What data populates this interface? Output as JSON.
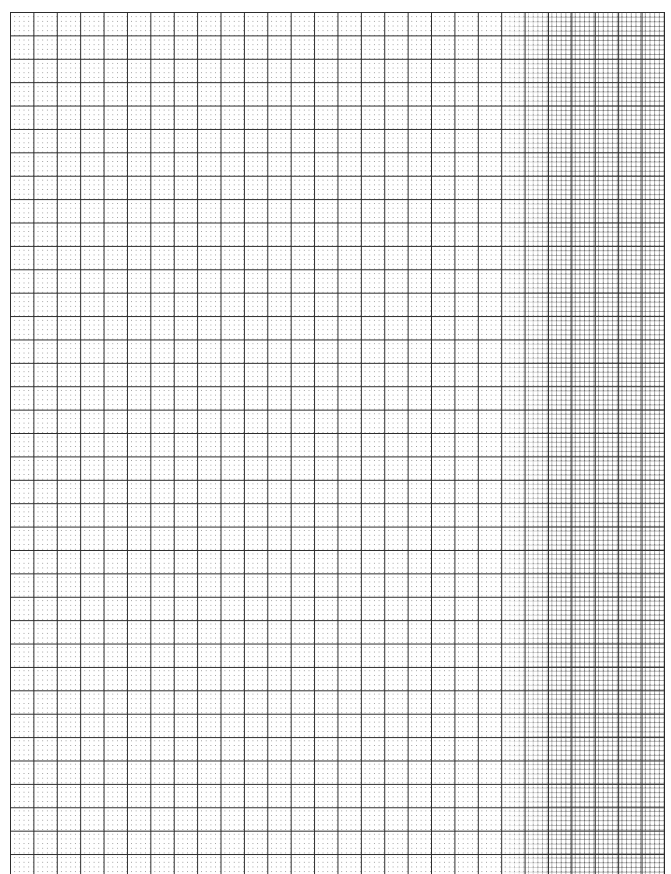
{
  "document": {
    "type": "blank graph paper",
    "grid": {
      "major_spacing_px": 23.4,
      "minor_divisions_per_major": 5,
      "minor_style": "dotted",
      "line_color": "#2a2a2a",
      "dot_color": "#9a9a9a",
      "background_color": "#ffffff"
    }
  }
}
